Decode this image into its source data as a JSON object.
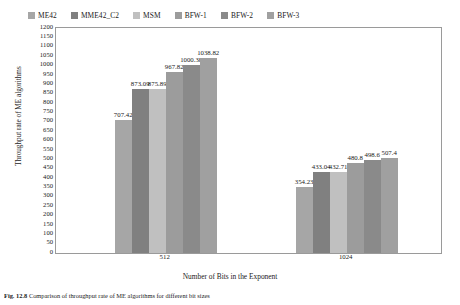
{
  "chart_data": {
    "type": "bar",
    "title": "",
    "xlabel": "Number of Bits in the Exponent",
    "ylabel": "Throughput rate of ME algorithms",
    "categories": [
      "512",
      "1024"
    ],
    "ylim": [
      0,
      1200
    ],
    "ytick_step": 50,
    "yticks": [
      "1200",
      "1150",
      "1100",
      "1050",
      "1000",
      "950",
      "900",
      "850",
      "800",
      "750",
      "700",
      "650",
      "600",
      "550",
      "500",
      "450",
      "400",
      "350",
      "300",
      "250",
      "200",
      "150",
      "100",
      "50",
      "0"
    ],
    "grid": false,
    "legend_position": "top-left",
    "series": [
      {
        "name": "ME42",
        "color": "#a6a6a6",
        "values": [
          707.42,
          354.23
        ]
      },
      {
        "name": "MME42_C2",
        "color": "#808080",
        "values": [
          873.09,
          433.04
        ]
      },
      {
        "name": "MSM",
        "color": "#c0c0c0",
        "values": [
          875.89,
          432.71
        ]
      },
      {
        "name": "BFW-1",
        "color": "#9c9c9c",
        "values": [
          967.82,
          480.8
        ]
      },
      {
        "name": "BFW-2",
        "color": "#8a8a8a",
        "values": [
          1000.38,
          498.6
        ]
      },
      {
        "name": "BFW-3",
        "color": "#a0a0a0",
        "values": [
          1038.82,
          507.4
        ]
      }
    ],
    "value_labels": [
      [
        "707.42",
        "873.09",
        "875.89",
        "967.82",
        "1000.38",
        "1038.82"
      ],
      [
        "354.23",
        "433.04",
        "432.71",
        "480.8",
        "498.6",
        "507.4"
      ]
    ]
  },
  "caption": {
    "figure_number": "Fig. 12.8",
    "text": "Comparison of throughput rate of ME algorithms for different bit sizes"
  }
}
